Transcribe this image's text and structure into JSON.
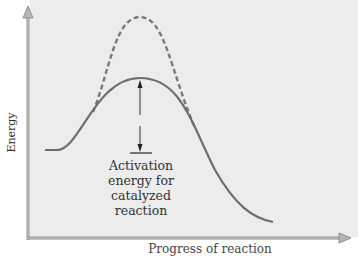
{
  "diagram": {
    "title": "",
    "y_axis_label": "Energy",
    "x_axis_label": "Progress of reaction",
    "annotation": {
      "line1": "Activation",
      "line2": "energy for",
      "line3": "catalyzed",
      "line4": "reaction"
    },
    "curves": [
      {
        "name": "uncatalyzed",
        "style": "dashed",
        "color": "#7a7a7a"
      },
      {
        "name": "catalyzed",
        "style": "solid",
        "color": "#6e6e6e"
      }
    ],
    "colors": {
      "background": "#ececec",
      "axis": "#9a9a9a",
      "curve": "#6e6e6e",
      "arrow": "#333333",
      "text": "#333333"
    }
  }
}
